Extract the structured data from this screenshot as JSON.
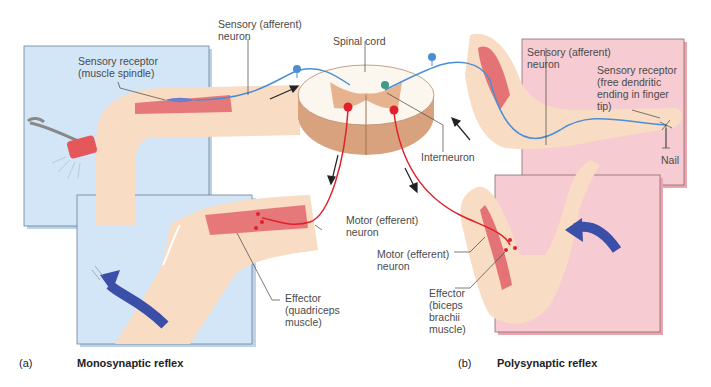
{
  "figure": {
    "panel_a": {
      "letter": "(a)",
      "title": "Monosynaptic reflex",
      "labels": {
        "sensory_neuron": "Sensory (afferent)\nneuron",
        "sensory_receptor": "Sensory receptor\n(muscle spindle)",
        "motor_neuron": "Motor (efferent)\nneuron",
        "effector": "Effector\n(quadriceps\nmuscle)"
      },
      "panel_color": "#cfe3f5"
    },
    "center": {
      "spinal_cord": "Spinal cord",
      "interneuron": "Interneuron"
    },
    "panel_b": {
      "letter": "(b)",
      "title": "Polysynaptic reflex",
      "labels": {
        "sensory_neuron": "Sensory (afferent)\nneuron",
        "sensory_receptor": "Sensory receptor\n(free dendritic\nending in finger\ntip)",
        "nail": "Nail",
        "motor_neuron": "Motor (efferent)\nneuron",
        "effector": "Effector\n(biceps\nbrachii\nmuscle)"
      },
      "panel_color": "#f4c6cc"
    },
    "colors": {
      "sensory": "#4a8fd6",
      "motor": "#e0202a",
      "skin": "#f8d9bf",
      "muscle": "#e8797a",
      "cord_gray": "#d9a27e",
      "arrow_blue": "#3b4fa8"
    }
  }
}
